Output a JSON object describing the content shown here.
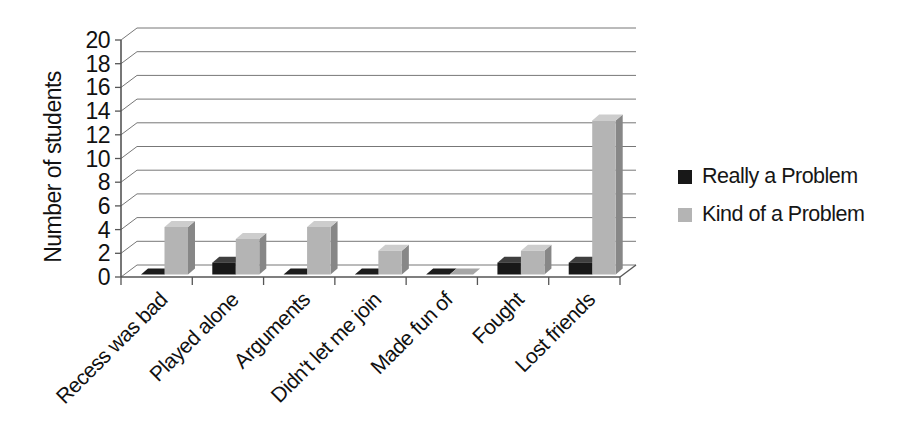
{
  "chart_data": {
    "type": "bar",
    "style": "3d-column",
    "title": "",
    "xlabel": "",
    "ylabel": "Number of students",
    "categories": [
      "Recess was bad",
      "Played alone",
      "Arguments",
      "Didn't let me join",
      "Made fun of",
      "Fought",
      "Lost friends"
    ],
    "series": [
      {
        "name": "Really a Problem",
        "values": [
          0,
          1,
          0,
          0,
          0,
          1,
          1
        ],
        "color_front": "#181818",
        "color_top": "#3f3f3f",
        "color_side": "#262626",
        "color_flat": "#1c1c1c"
      },
      {
        "name": "Kind of a Problem",
        "values": [
          4,
          3,
          4,
          2,
          0,
          2,
          13
        ],
        "color_front": "#b4b4b4",
        "color_top": "#cdcdcd",
        "color_side": "#878787",
        "color_flat": "#a6a6a6"
      }
    ],
    "ylim": [
      0,
      20
    ],
    "ytick_step": 2,
    "yticks": [
      0,
      2,
      4,
      6,
      8,
      10,
      12,
      14,
      16,
      18,
      20
    ],
    "grid": true,
    "legend_position": "right",
    "colors": {
      "text": "#111111",
      "gridline": "#777777",
      "axis": "#555555",
      "background": "#ffffff"
    }
  }
}
